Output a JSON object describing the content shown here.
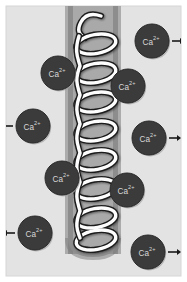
{
  "figure": {
    "width": 187,
    "height": 282,
    "panel": {
      "x": 6,
      "y": 6,
      "width": 175,
      "height": 270,
      "background_color": "#e3e3e3",
      "border_color": "#d6d6d6"
    },
    "membrane": {
      "name": "membrane-band",
      "x": 68,
      "width": 50,
      "edge_color": "#8d8d8d",
      "fill_color": "#a9a9a9",
      "shadow_color": "#7f7f7f"
    },
    "channel_helix": {
      "name": "channel-protein-helix",
      "stroke_color": "#1c1c1c",
      "fill_color": "#fdfdfd",
      "coil_count": 8,
      "center_x": 92,
      "top_y": 14,
      "bottom_y": 248
    },
    "colors": {
      "background": "#e3e3e3",
      "membrane_fill": "#a9a9a9",
      "membrane_edge": "#8d8d8d",
      "ion_fill": "#3b3b3b",
      "ion_edge": "#2a2a2a",
      "ion_text": "#d8d8d8",
      "arrow": "#1a1a1a",
      "helix_outline": "#1c1c1c",
      "helix_fill": "#fdfdfd"
    },
    "arrow": {
      "name": "ion-flow-arrow",
      "length": 14,
      "head_size": 4
    }
  },
  "ions": [
    {
      "id": "ion-top-right",
      "label_element": "Ca",
      "label_charge": "2+",
      "cx": 152,
      "cy": 41,
      "r": 17,
      "arrow": "right",
      "arrow_from_x": 172,
      "arrow_to_x": 184,
      "arrow_y": 41
    },
    {
      "id": "ion-upper-left",
      "label_element": "Ca",
      "label_charge": "2+",
      "cx": 58,
      "cy": 73,
      "r": 17,
      "arrow": "none",
      "arrow_from_x": 0,
      "arrow_to_x": 0,
      "arrow_y": 0
    },
    {
      "id": "ion-upper-right",
      "label_element": "Ca",
      "label_charge": "2+",
      "cx": 128,
      "cy": 86,
      "r": 17,
      "arrow": "none",
      "arrow_from_x": 0,
      "arrow_to_x": 0,
      "arrow_y": 0
    },
    {
      "id": "ion-mid-left",
      "label_element": "Ca",
      "label_charge": "2+",
      "cx": 33,
      "cy": 126,
      "r": 17,
      "arrow": "left",
      "arrow_from_x": 13,
      "arrow_to_x": 2,
      "arrow_y": 126
    },
    {
      "id": "ion-mid-right",
      "label_element": "Ca",
      "label_charge": "2+",
      "cx": 149,
      "cy": 138,
      "r": 17,
      "arrow": "right",
      "arrow_from_x": 169,
      "arrow_to_x": 181,
      "arrow_y": 138
    },
    {
      "id": "ion-lower-left",
      "label_element": "Ca",
      "label_charge": "2+",
      "cx": 62,
      "cy": 178,
      "r": 17,
      "arrow": "none",
      "arrow_from_x": 0,
      "arrow_to_x": 0,
      "arrow_y": 0
    },
    {
      "id": "ion-lower-right",
      "label_element": "Ca",
      "label_charge": "2+",
      "cx": 127,
      "cy": 190,
      "r": 17,
      "arrow": "none",
      "arrow_from_x": 0,
      "arrow_to_x": 0,
      "arrow_y": 0
    },
    {
      "id": "ion-bottom-left",
      "label_element": "Ca",
      "label_charge": "2+",
      "cx": 35,
      "cy": 233,
      "r": 17,
      "arrow": "left",
      "arrow_from_x": 15,
      "arrow_to_x": 3,
      "arrow_y": 233
    },
    {
      "id": "ion-bottom-right",
      "label_element": "Ca",
      "label_charge": "2+",
      "cx": 148,
      "cy": 252,
      "r": 17,
      "arrow": "right",
      "arrow_from_x": 168,
      "arrow_to_x": 181,
      "arrow_y": 252
    }
  ]
}
